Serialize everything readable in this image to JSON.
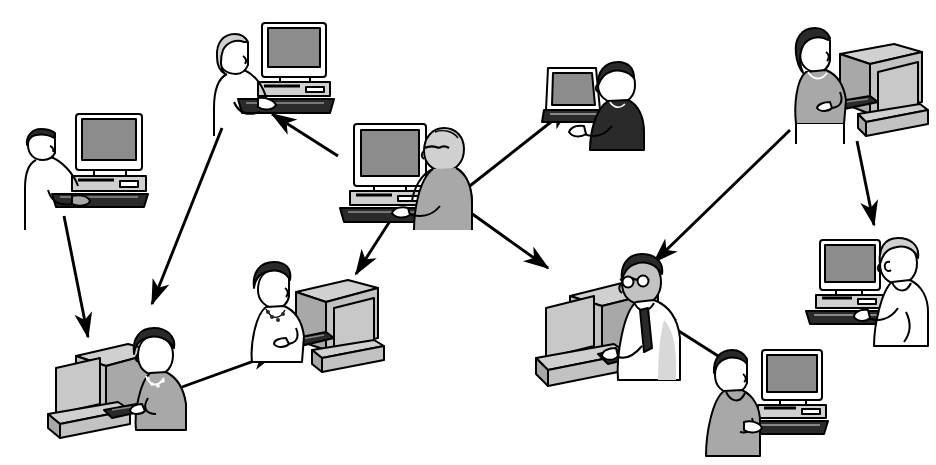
{
  "image": {
    "kind": "line-art-clipart-diagram",
    "subject": "Nine people working at desktop computers connected by directional arrows",
    "width": 936,
    "height": 465,
    "background_color": "#ffffff",
    "line_color": "#000000",
    "shade_mid": "#a8a8a8",
    "shade_light": "#d0d0d0",
    "shade_dark": "#2a2a2a",
    "screen_fill": "#8c8c8c",
    "style_notes": "black outline clip-art with halftone dot shading, no text labels present"
  },
  "nodes": [
    {
      "id": "n1",
      "name": "man-left-standing",
      "label": "Man at desktop computer, upper left",
      "hair": "dark",
      "clothing": "white shirt",
      "facing": "right",
      "device": "crt-monitor-with-base",
      "x": 22,
      "y": 108
    },
    {
      "id": "n2",
      "name": "woman-top-center",
      "label": "Woman at desktop computer, top center",
      "hair": "light gray",
      "clothing": "white blouse",
      "facing": "right",
      "device": "crt-monitor-with-base",
      "x": 206,
      "y": 18
    },
    {
      "id": "n3",
      "name": "man-center-hub-bald",
      "label": "Bald man with glasses at desktop computer, center",
      "hair": "bald",
      "clothing": "gray shirt",
      "facing": "left",
      "device": "crt-monitor-with-base",
      "x": 336,
      "y": 118
    },
    {
      "id": "n4",
      "name": "person-laptop-top-right",
      "label": "Person at laptop computer, upper right of center",
      "hair": "dark",
      "clothing": "black top",
      "facing": "left",
      "device": "laptop",
      "x": 540,
      "y": 58
    },
    {
      "id": "n5",
      "name": "woman-far-top-right",
      "label": "Woman at desktop computer, far upper right",
      "hair": "dark long",
      "clothing": "gray top",
      "facing": "right",
      "device": "crt-monitor-rear-view",
      "x": 782,
      "y": 18
    },
    {
      "id": "n6",
      "name": "woman-bottom-left",
      "label": "Woman with necklace at desktop computer, bottom left",
      "hair": "dark bob",
      "clothing": "gray blouse",
      "facing": "left",
      "device": "crt-monitor-rear-view",
      "x": 42,
      "y": 320
    },
    {
      "id": "n7",
      "name": "woman-bottom-center",
      "label": "Woman with necklace at desktop computer, bottom center",
      "hair": "dark bob",
      "clothing": "white blouse",
      "facing": "right",
      "device": "crt-monitor-rear-view",
      "x": 240,
      "y": 252
    },
    {
      "id": "n8",
      "name": "man-bottom-hub-tie",
      "label": "Man with glasses and tie at desktop computer, bottom center right",
      "hair": "dark",
      "clothing": "white shirt with dark tie",
      "facing": "left",
      "device": "crt-monitor-rear-view",
      "x": 522,
      "y": 248
    },
    {
      "id": "n9",
      "name": "man-bottom-right-suit",
      "label": "Man in gray suit at desktop computer, bottom right",
      "hair": "dark",
      "clothing": "gray suit",
      "facing": "right",
      "device": "crt-monitor-with-base",
      "x": 700,
      "y": 344
    },
    {
      "id": "n10",
      "name": "person-right-gray-hair",
      "label": "Person with gray hair at desktop computer, right",
      "hair": "light gray",
      "clothing": "white shirt",
      "facing": "left",
      "device": "crt-monitor-with-base",
      "x": 802,
      "y": 234
    }
  ],
  "arrows": [
    {
      "id": "a1",
      "name": "arrow-left-man-to-bottom-left-woman",
      "from": "n1",
      "to": "n6",
      "x1": 64,
      "y1": 216,
      "x2": 88,
      "y2": 337,
      "direction": "down"
    },
    {
      "id": "a2",
      "name": "arrow-top-center-woman-to-bottom-left-woman",
      "from": "n2",
      "to": "n6",
      "x1": 222,
      "y1": 128,
      "x2": 152,
      "y2": 304,
      "direction": "down-left"
    },
    {
      "id": "a3",
      "name": "arrow-center-hub-to-top-center-woman",
      "from": "n3",
      "to": "n2",
      "x1": 338,
      "y1": 156,
      "x2": 272,
      "y2": 114,
      "direction": "up-left"
    },
    {
      "id": "a4",
      "name": "arrow-center-hub-to-bottom-center-woman",
      "from": "n3",
      "to": "n7",
      "x1": 390,
      "y1": 221,
      "x2": 356,
      "y2": 274,
      "direction": "down-left"
    },
    {
      "id": "a5",
      "name": "arrow-center-hub-to-laptop-person",
      "from": "n3",
      "to": "n4",
      "x1": 466,
      "y1": 189,
      "x2": 570,
      "y2": 107,
      "direction": "up-right"
    },
    {
      "id": "a6",
      "name": "arrow-center-hub-to-bottom-hub",
      "from": "n3",
      "to": "n8",
      "x1": 464,
      "y1": 208,
      "x2": 548,
      "y2": 268,
      "direction": "down-right"
    },
    {
      "id": "a7",
      "name": "arrow-bottom-left-woman-to-bottom-center-woman",
      "from": "n6",
      "to": "n7",
      "x1": 182,
      "y1": 387,
      "x2": 276,
      "y2": 353,
      "direction": "up-right"
    },
    {
      "id": "a8",
      "name": "arrow-far-top-right-woman-to-bottom-hub",
      "from": "n5",
      "to": "n8",
      "x1": 790,
      "y1": 130,
      "x2": 654,
      "y2": 262,
      "direction": "down-left"
    },
    {
      "id": "a9",
      "name": "arrow-far-top-right-woman-to-right-person",
      "from": "n5",
      "to": "n10",
      "x1": 857,
      "y1": 141,
      "x2": 874,
      "y2": 225,
      "direction": "down"
    },
    {
      "id": "a10",
      "name": "arrow-bottom-right-man-to-bottom-hub",
      "from": "n9",
      "to": "n8",
      "x1": 726,
      "y1": 361,
      "x2": 652,
      "y2": 314,
      "direction": "up-left"
    }
  ],
  "counts": {
    "people": 10,
    "desktop_computers": 9,
    "laptops": 1,
    "arrows": 10
  }
}
